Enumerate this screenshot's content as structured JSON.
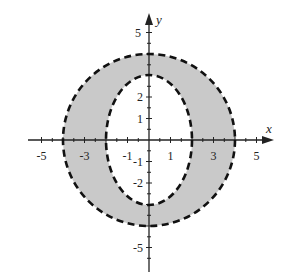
{
  "figure": {
    "axes": {
      "x_label": "x",
      "y_label": "y",
      "x_tick_labels": [
        "-5",
        "-3",
        "-1",
        "1",
        "3",
        "5"
      ],
      "y_tick_labels": [
        "5",
        "2",
        "1",
        "-1",
        "-2",
        "-5"
      ],
      "range": [
        -5.5,
        5.5
      ]
    },
    "curves": [
      {
        "name": "outer-circle",
        "type": "ellipse",
        "rx": 4,
        "ry": 4,
        "style": "dashed"
      },
      {
        "name": "inner-ellipse",
        "type": "ellipse",
        "rx": 2,
        "ry": 3,
        "style": "dashed"
      }
    ],
    "colors": {
      "fill": "#c9c9c9",
      "stroke": "#111111",
      "axis": "#222222"
    }
  }
}
